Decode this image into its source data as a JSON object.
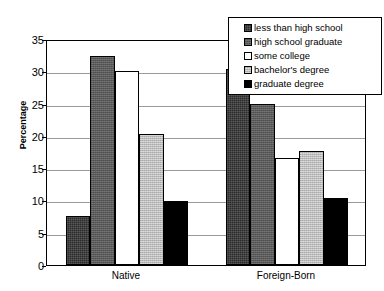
{
  "chart_data": {
    "type": "bar",
    "title": "",
    "subtitle": "",
    "xlabel": "",
    "ylabel": "Percentage",
    "ylim": [
      0,
      35
    ],
    "yticks": [
      0,
      5,
      10,
      15,
      20,
      25,
      30,
      35
    ],
    "ytick_labels": [
      "0",
      "5",
      "10",
      "15",
      "20",
      "25",
      "30",
      "35"
    ],
    "grid": true,
    "grid_axis": "y",
    "legend_position": "top-right",
    "categories": [
      "Native",
      "Foreign-Born"
    ],
    "series": [
      {
        "name": "less than high school",
        "values": [
          7.6,
          30.3
        ],
        "color": "#0a0a0a",
        "fill_style": "solid-dark"
      },
      {
        "name": "high school graduate",
        "values": [
          32.4,
          25.0
        ],
        "color": "#595959",
        "fill_style": "medium-gray-texture"
      },
      {
        "name": "some college",
        "values": [
          30.0,
          16.6
        ],
        "color": "#ffffff",
        "fill_style": "white"
      },
      {
        "name": "bachelor's degree",
        "values": [
          20.3,
          17.7
        ],
        "color": "#bcbcbc",
        "fill_style": "light-gray-texture"
      },
      {
        "name": "graduate degree",
        "values": [
          9.9,
          10.4
        ],
        "color": "#000000",
        "fill_style": "solid-black"
      }
    ],
    "annotations": []
  },
  "legend": {
    "items": [
      {
        "label": "less than high school",
        "swatch": "legend-swatch-dark"
      },
      {
        "label": "high school graduate",
        "swatch": "legend-swatch-medium-gray"
      },
      {
        "label": "some college",
        "swatch": "legend-swatch-white"
      },
      {
        "label": "bachelor's degree",
        "swatch": "legend-swatch-light-gray"
      },
      {
        "label": "graduate degree",
        "swatch": "legend-swatch-black"
      }
    ]
  }
}
